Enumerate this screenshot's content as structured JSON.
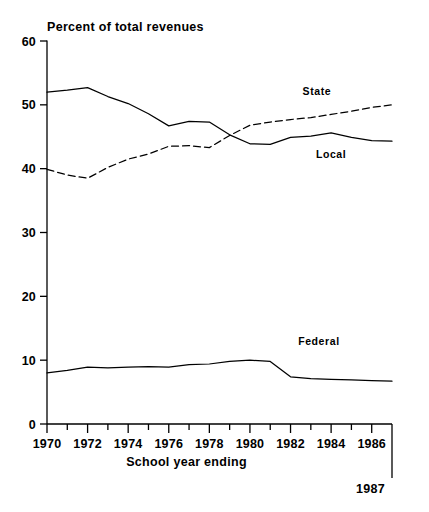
{
  "chart_data": {
    "type": "line",
    "title": "",
    "ylabel": "Percent of total revenues",
    "xlabel": "School year ending",
    "ylim": [
      0,
      60
    ],
    "yticks": [
      0,
      10,
      20,
      30,
      40,
      50,
      60
    ],
    "xlim": [
      1970,
      1987
    ],
    "x": [
      1970,
      1971,
      1972,
      1973,
      1974,
      1975,
      1976,
      1977,
      1978,
      1979,
      1980,
      1981,
      1982,
      1983,
      1984,
      1985,
      1986,
      1987
    ],
    "xticks": [
      1970,
      1971,
      1972,
      1973,
      1974,
      1975,
      1976,
      1977,
      1978,
      1979,
      1980,
      1981,
      1982,
      1983,
      1984,
      1985,
      1986,
      1987
    ],
    "xticklabels": [
      "1970",
      "",
      "1972",
      "",
      "1974",
      "",
      "1976",
      "",
      "1978",
      "",
      "1980",
      "",
      "1982",
      "",
      "1984",
      "",
      "1986",
      ""
    ],
    "end_label": "1987",
    "grid": false,
    "legend_position": "inline-right",
    "series": [
      {
        "name": "Local",
        "style": "solid",
        "label_x": 1984.0,
        "label_y": 41.6,
        "values": [
          52.0,
          52.3,
          52.7,
          51.3,
          50.2,
          48.6,
          46.7,
          47.4,
          47.3,
          45.3,
          43.9,
          43.8,
          44.9,
          45.1,
          45.6,
          44.9,
          44.4,
          44.3
        ]
      },
      {
        "name": "State",
        "style": "dashed",
        "label_x": 1983.3,
        "label_y": 51.5,
        "values": [
          39.9,
          39.0,
          38.5,
          40.2,
          41.5,
          42.3,
          43.5,
          43.6,
          43.3,
          45.2,
          46.8,
          47.3,
          47.7,
          48.0,
          48.5,
          49.0,
          49.6,
          50.0
        ]
      },
      {
        "name": "Federal",
        "style": "solid",
        "label_x": 1983.4,
        "label_y": 12.3,
        "values": [
          8.0,
          8.4,
          8.9,
          8.8,
          8.9,
          9.0,
          8.9,
          9.3,
          9.4,
          9.8,
          10.0,
          9.8,
          7.4,
          7.1,
          7.0,
          6.9,
          6.8,
          6.7
        ]
      }
    ]
  },
  "figure": {
    "axis_color": "#000000",
    "line_color": "#000000"
  }
}
